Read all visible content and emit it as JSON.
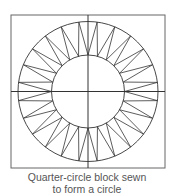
{
  "figure": {
    "caption_lines": [
      "Quarter-circle block sewn",
      "to form a circle"
    ],
    "diagram": {
      "square": {
        "x": 11,
        "y": 15,
        "width": 154,
        "height": 153
      },
      "center": {
        "x": 88,
        "y": 91.5
      },
      "outer_radius": 70,
      "inner_radius": 36.5,
      "segments_per_quadrant": 12,
      "line_color": "#333333",
      "square_color": "#666666"
    }
  }
}
